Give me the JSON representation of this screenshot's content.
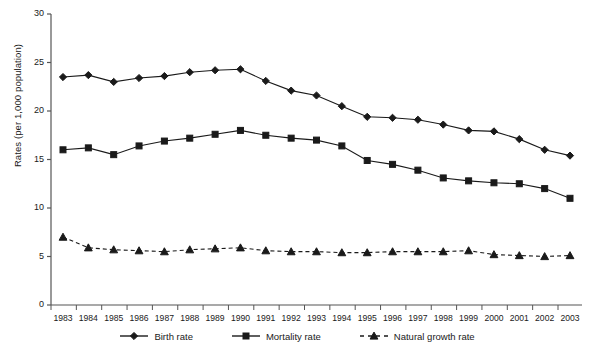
{
  "chart_data": {
    "type": "line",
    "title": "",
    "xlabel": "",
    "ylabel": "Rates (per 1,000 population)",
    "categories": [
      "1983",
      "1984",
      "1985",
      "1986",
      "1987",
      "1988",
      "1989",
      "1990",
      "1991",
      "1992",
      "1993",
      "1994",
      "1995",
      "1996",
      "1997",
      "1998",
      "1999",
      "2000",
      "2001",
      "2002",
      "2003"
    ],
    "x": [
      1983,
      1984,
      1985,
      1986,
      1987,
      1988,
      1989,
      1990,
      1991,
      1992,
      1993,
      1994,
      1995,
      1996,
      1997,
      1998,
      1999,
      2000,
      2001,
      2002,
      2003
    ],
    "ylim": [
      0,
      30
    ],
    "yticks": [
      0,
      5,
      10,
      15,
      20,
      25,
      30
    ],
    "ytick_labels": [
      "0",
      "5",
      "10",
      "15",
      "20",
      "25",
      "30"
    ],
    "grid": false,
    "legend_position": "bottom",
    "series": [
      {
        "name": "Birth rate",
        "marker": "diamond",
        "linestyle": "solid",
        "color": "#1a1a1a",
        "values": [
          23.5,
          23.7,
          23.0,
          23.4,
          23.6,
          24.0,
          24.2,
          24.3,
          23.1,
          22.1,
          21.6,
          20.5,
          19.4,
          19.3,
          19.1,
          18.6,
          18.0,
          17.9,
          17.1,
          16.0,
          15.4
        ]
      },
      {
        "name": "Mortality rate",
        "marker": "square",
        "linestyle": "solid",
        "color": "#1a1a1a",
        "values": [
          16.0,
          16.2,
          15.5,
          16.4,
          16.9,
          17.2,
          17.6,
          18.0,
          17.5,
          17.2,
          17.0,
          16.4,
          14.9,
          14.5,
          13.9,
          13.1,
          12.8,
          12.6,
          12.5,
          12.0,
          11.0
        ]
      },
      {
        "name": "Natural growth rate",
        "marker": "triangle",
        "linestyle": "dashed",
        "color": "#1a1a1a",
        "values": [
          7.0,
          5.9,
          5.7,
          5.6,
          5.5,
          5.7,
          5.8,
          5.9,
          5.6,
          5.5,
          5.5,
          5.4,
          5.4,
          5.5,
          5.5,
          5.5,
          5.6,
          5.2,
          5.1,
          5.0,
          5.1
        ]
      }
    ]
  },
  "axes": {
    "y_axis_title": "Rates (per 1,000 population)"
  },
  "legend": {
    "items": [
      {
        "label": "Birth rate"
      },
      {
        "label": "Mortality rate"
      },
      {
        "label": "Natural growth rate"
      }
    ]
  },
  "colors": {
    "line": "#1a1a1a",
    "axis": "#555555",
    "background": "#ffffff"
  }
}
